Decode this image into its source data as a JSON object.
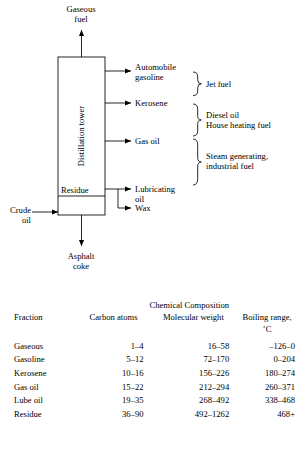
{
  "diagram": {
    "tower_label": "Distillation tower",
    "residue_label": "Residue",
    "top_output": "Gaseous\nfuel",
    "input": "Crude\noil",
    "bottom_output": "Asphalt\ncoke",
    "outputs": [
      {
        "name": "automobile-gasoline",
        "label": "Automobile\ngasoline"
      },
      {
        "name": "kerosene",
        "label": "Kerosene"
      },
      {
        "name": "gas-oil",
        "label": "Gas oil"
      },
      {
        "name": "lubricating-oil",
        "label": "Lubricating\noil"
      },
      {
        "name": "wax",
        "label": "Wax"
      }
    ],
    "uses": [
      {
        "name": "jet-fuel",
        "label": "Jet fuel"
      },
      {
        "name": "diesel-house-heating",
        "label": "Diesel oil\nHouse heating fuel"
      },
      {
        "name": "steam-industrial",
        "label": "Steam generating,\nindustrial fuel"
      }
    ]
  },
  "table": {
    "group_header": "Chemical Composition",
    "headers": {
      "fraction": "Fraction",
      "carbon": "Carbon\natoms",
      "molecular_weight": "Molecular\nweight",
      "boiling": "Boiling\nrange, ˚C"
    },
    "rows": [
      {
        "fraction": "Gaseous",
        "carbon": "1–4",
        "molecular_weight": "16–58",
        "boiling": "–126–0"
      },
      {
        "fraction": "Gasoline",
        "carbon": "5–12",
        "molecular_weight": "72–170",
        "boiling": "0–204"
      },
      {
        "fraction": "Kerosene",
        "carbon": "10–16",
        "molecular_weight": "156–226",
        "boiling": "180–274"
      },
      {
        "fraction": "Gas oil",
        "carbon": "15–22",
        "molecular_weight": "212–294",
        "boiling": "260–371"
      },
      {
        "fraction": "Lube oil",
        "carbon": "19–35",
        "molecular_weight": "268–492",
        "boiling": "338–468"
      },
      {
        "fraction": "Residue",
        "carbon": "36–90",
        "molecular_weight": "492–1262",
        "boiling": "468+"
      }
    ]
  },
  "colors": {
    "line": "#000000",
    "background": "#ffffff"
  }
}
